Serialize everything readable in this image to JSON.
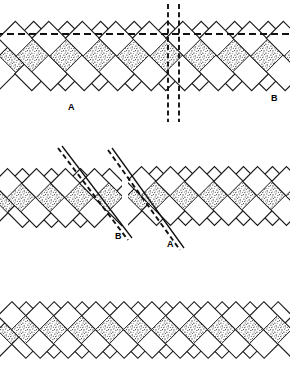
{
  "figure": {
    "title": "",
    "background_color": "#ffffff",
    "line_color": "#1a1a1a",
    "stipple_color": "#2b2b2b",
    "width": 290,
    "height": 368,
    "panels": [
      {
        "id": "panel-a",
        "name": "upper-diagram",
        "y": 4,
        "height": 118,
        "description": "interlocking lamellae with horizontal dashed trace and paired vertical dashed lines",
        "labels": [
          {
            "text": "A",
            "x": 72,
            "y": 108
          },
          {
            "text": "B",
            "x": 273,
            "y": 100
          }
        ],
        "reference_lines": [
          {
            "name": "horizontal-dashed-trace",
            "type": "dashed-horizontal",
            "y": 34
          },
          {
            "name": "vertical-dashed-left",
            "type": "dashed-vertical",
            "x": 168
          },
          {
            "name": "vertical-dashed-right",
            "type": "dashed-vertical",
            "x": 179
          }
        ]
      },
      {
        "id": "panel-b",
        "name": "middle-diagram",
        "y": 150,
        "height": 112,
        "description": "two offset lamellar domains separated by inclined dashed composition planes",
        "labels": [
          {
            "text": "B",
            "x": 118,
            "y": 236
          },
          {
            "text": "A",
            "x": 170,
            "y": 244
          }
        ],
        "reference_lines": [
          {
            "name": "inclined-dashed-left",
            "type": "dashed-inclined",
            "angle_deg": 45
          },
          {
            "name": "inclined-dashed-right",
            "type": "dashed-inclined",
            "angle_deg": 45
          }
        ]
      },
      {
        "id": "panel-c",
        "name": "lower-diagram",
        "y": 292,
        "height": 76,
        "description": "continuous untwinned lamellar weave, no reference lines",
        "labels": [],
        "reference_lines": []
      }
    ]
  }
}
